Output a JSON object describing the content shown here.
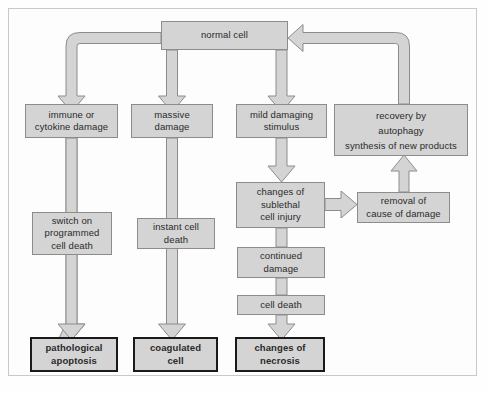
{
  "diagram": {
    "colors": {
      "node_fill": "#d4d4d4",
      "node_border": "#8c8c8c",
      "outcome_border": "#1a1a1a",
      "arrow_fill": "#d4d4d4",
      "arrow_stroke": "#8c8c8c",
      "frame_border": "#c9c9c9",
      "page_background": "#fdfdfd",
      "text": "#2a2a2a"
    },
    "nodes": [
      {
        "id": "normal-cell",
        "label": "normal cell"
      },
      {
        "id": "immune-cytokine",
        "label": "immune or\ncytokine damage"
      },
      {
        "id": "massive-damage",
        "label": "massive\ndamage"
      },
      {
        "id": "mild-stimulus",
        "label": "mild damaging\nstimulus"
      },
      {
        "id": "recovery-autophagy",
        "label": "recovery by\nautophagy\nsynthesis of new products"
      },
      {
        "id": "sublethal-injury",
        "label": "changes of\nsublethal\ncell injury"
      },
      {
        "id": "removal-cause",
        "label": "removal of\ncause of damage"
      },
      {
        "id": "switch-apoptosis",
        "label": "switch on\nprogrammed\ncell death"
      },
      {
        "id": "instant-death",
        "label": "instant cell\ndeath"
      },
      {
        "id": "continued-damage",
        "label": "continued\ndamage"
      },
      {
        "id": "cell-death",
        "label": "cell death"
      },
      {
        "id": "pathological-apoptosis",
        "label": "pathological\napoptosis"
      },
      {
        "id": "coagulated-cell",
        "label": "coagulated\ncell"
      },
      {
        "id": "changes-necrosis",
        "label": "changes of\nnecrosis"
      }
    ],
    "edges": [
      {
        "from": "normal-cell",
        "to": "immune-cytokine",
        "kind": "elbow-left-down"
      },
      {
        "from": "normal-cell",
        "to": "massive-damage",
        "kind": "straight-down"
      },
      {
        "from": "normal-cell",
        "to": "mild-stimulus",
        "kind": "straight-down"
      },
      {
        "from": "recovery-autophagy",
        "to": "normal-cell",
        "kind": "elbow-up-left"
      },
      {
        "from": "immune-cytokine",
        "to": "switch-apoptosis",
        "kind": "through-down"
      },
      {
        "from": "massive-damage",
        "to": "instant-death",
        "kind": "through-down"
      },
      {
        "from": "mild-stimulus",
        "to": "sublethal-injury",
        "kind": "straight-down"
      },
      {
        "from": "sublethal-injury",
        "to": "removal-cause",
        "kind": "straight-right"
      },
      {
        "from": "removal-cause",
        "to": "recovery-autophagy",
        "kind": "straight-up"
      },
      {
        "from": "sublethal-injury",
        "to": "continued-damage",
        "kind": "straight-down"
      },
      {
        "from": "continued-damage",
        "to": "cell-death",
        "kind": "straight-down"
      },
      {
        "from": "switch-apoptosis",
        "to": "pathological-apoptosis",
        "kind": "straight-down"
      },
      {
        "from": "instant-death",
        "to": "coagulated-cell",
        "kind": "straight-down"
      },
      {
        "from": "cell-death",
        "to": "changes-necrosis",
        "kind": "straight-down"
      }
    ]
  }
}
